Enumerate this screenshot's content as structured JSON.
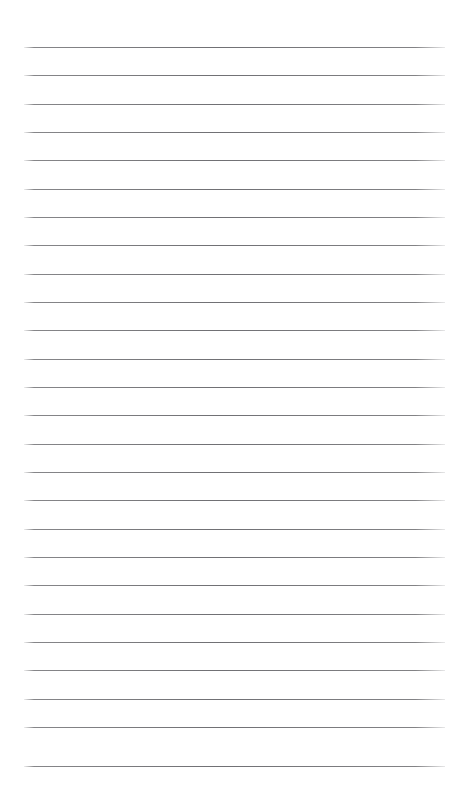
{
  "document": {
    "kind": "lined-notepad-page",
    "title": "",
    "body_text": "",
    "page_width": 459,
    "page_height": 792,
    "background_color": "#ffffff",
    "rule_color": "#707074",
    "rule_thickness": 1,
    "rule_count": 26,
    "rule_left": 24,
    "rule_right": 445,
    "rule_width": 421,
    "first_rule_y": 47,
    "rule_spacing": 28.4,
    "top_margin": 47,
    "bottom_margin": 26,
    "rule_y_positions": [
      47,
      75,
      104,
      132,
      160,
      189,
      217,
      245,
      274,
      302,
      330,
      359,
      387,
      415,
      444,
      472,
      500,
      529,
      557,
      585,
      614,
      642,
      670,
      699,
      727,
      766
    ],
    "line_labels": [
      "line-1",
      "line-2",
      "line-3",
      "line-4",
      "line-5",
      "line-6",
      "line-7",
      "line-8",
      "line-9",
      "line-10",
      "line-11",
      "line-12",
      "line-13",
      "line-14",
      "line-15",
      "line-16",
      "line-17",
      "line-18",
      "line-19",
      "line-20",
      "line-21",
      "line-22",
      "line-23",
      "line-24",
      "line-25",
      "line-26"
    ]
  }
}
